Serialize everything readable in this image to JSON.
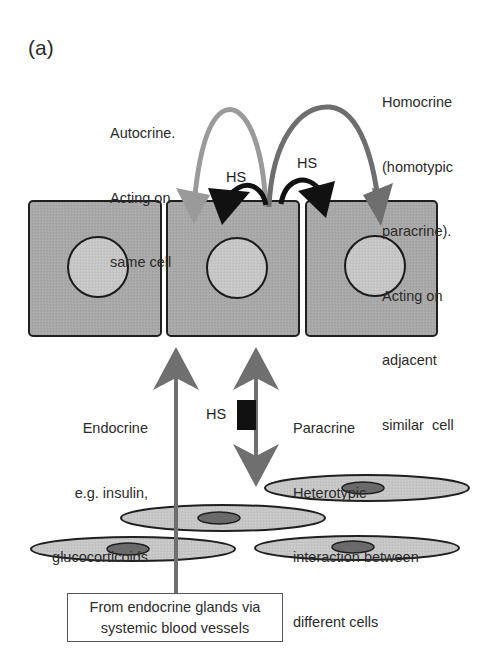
{
  "figure": {
    "panel_label": "(a)",
    "labels": {
      "autocrine": [
        "Autocrine.",
        "Acting on",
        "same cell"
      ],
      "homocrine": [
        "Homocrine",
        "(homotypic",
        "paracrine).",
        "Acting on",
        "adjacent",
        "similar  cell"
      ],
      "endocrine": [
        "Endocrine",
        "e.g. insulin,",
        "glucocorticoids",
        "(systemic)"
      ],
      "paracrine": [
        "Paracrine",
        "Heterotypic",
        "interaction between",
        "different cells"
      ],
      "hs_autocrine": "HS",
      "hs_homocrine": "HS",
      "hs_paracrine": "HS"
    },
    "source_box": [
      "From endocrine glands via",
      "systemic blood vessels"
    ],
    "colors": {
      "cell_fill": "#a9a9a9",
      "nucleus_fill": "#c8c8c8",
      "outline": "#1f1f1f",
      "autocrine_arrow": "#9a9a9a",
      "homocrine_arrow": "#6e6e6e",
      "hs_arrow": "#111111",
      "endocrine_arrow": "#6f6f6f",
      "paracrine_arrow": "#6f6f6f",
      "stromal_cell_fill": "#c4c4c4",
      "stromal_nucleus_fill": "#6a6a6a"
    },
    "epithelial_cells": 3,
    "stromal_cells": 4
  }
}
